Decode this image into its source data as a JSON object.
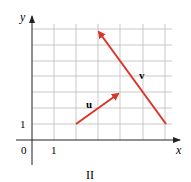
{
  "axes": {
    "x_label": "x",
    "y_label": "y",
    "origin_label": "0",
    "x_tick_label": "1",
    "y_tick_label": "1"
  },
  "vectors": [
    {
      "name": "u",
      "from": [
        2,
        1
      ],
      "to": [
        4,
        3
      ],
      "color": "#d9362b"
    },
    {
      "name": "v",
      "from": [
        6,
        1
      ],
      "to": [
        3,
        7
      ],
      "color": "#d9362b"
    }
  ],
  "caption": "II"
}
